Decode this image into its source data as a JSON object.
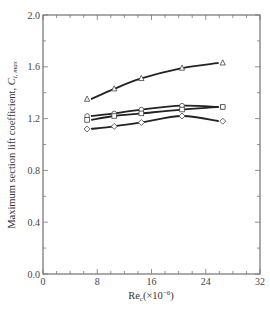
{
  "chart_data": {
    "type": "line",
    "title": "",
    "xlabel": "Re",
    "xlabel_sub": "c",
    "xlabel_suffix": "(×10",
    "xlabel_exp": "−6",
    "xlabel_close": ")",
    "ylabel": "Maximum section lift coefficient, ",
    "ylabel_symbol": "C",
    "ylabel_sub": "l, max",
    "xlim": [
      0,
      32
    ],
    "ylim": [
      0.0,
      2.0
    ],
    "xticks": [
      0,
      8,
      16,
      24,
      32
    ],
    "xtick_labels": [
      "0",
      "8",
      "16",
      "24",
      "32"
    ],
    "yticks": [
      0.0,
      0.4,
      0.8,
      1.2,
      1.6,
      2.0
    ],
    "ytick_labels": [
      "0.0",
      "0.4",
      "0.8",
      "1.2",
      "1.6",
      "2.0"
    ],
    "minor_ticks_per_major": 4,
    "grid": false,
    "legend": "none",
    "series": [
      {
        "name": "triangle",
        "marker": "triangle",
        "x": [
          6.5,
          10.5,
          14.5,
          20.5,
          26.5
        ],
        "y": [
          1.35,
          1.43,
          1.51,
          1.59,
          1.63
        ]
      },
      {
        "name": "circle",
        "marker": "circle",
        "x": [
          6.5,
          10.5,
          14.5,
          20.5,
          26.5
        ],
        "y": [
          1.22,
          1.24,
          1.27,
          1.3,
          1.29
        ]
      },
      {
        "name": "square",
        "marker": "square",
        "x": [
          6.5,
          10.5,
          14.5,
          20.5,
          26.5
        ],
        "y": [
          1.19,
          1.22,
          1.24,
          1.27,
          1.29
        ]
      },
      {
        "name": "diamond",
        "marker": "diamond",
        "x": [
          6.5,
          10.5,
          14.5,
          20.5,
          26.5
        ],
        "y": [
          1.12,
          1.14,
          1.17,
          1.22,
          1.18
        ]
      }
    ]
  }
}
